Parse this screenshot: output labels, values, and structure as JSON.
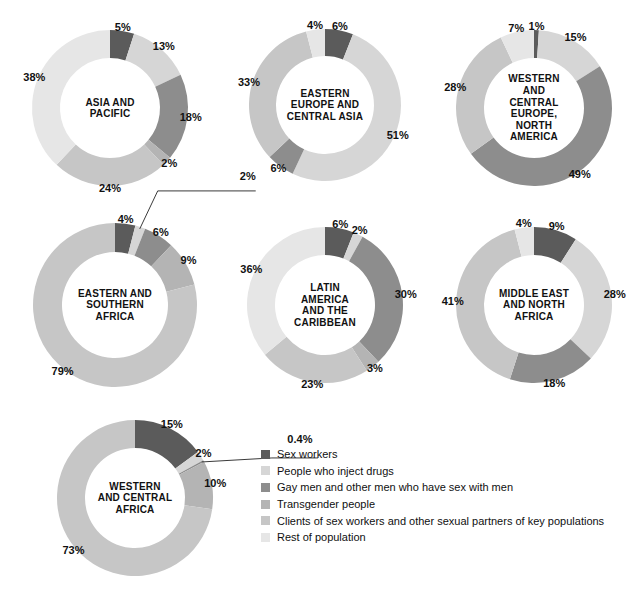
{
  "chart_data": {
    "type": "pie",
    "title": "",
    "legend_position": "bottom-right",
    "categories": [
      "Sex workers",
      "People who inject drugs",
      "Gay men and other men who have sex with men",
      "Transgender people",
      "Clients of sex workers and other sexual partners of key populations",
      "Rest of population"
    ],
    "colors": [
      "#5b5b5b",
      "#d6d6d6",
      "#8d8d8d",
      "#b4b4b4",
      "#c6c6c6",
      "#e6e6e6"
    ],
    "charts": [
      {
        "id": "asia-and-pacific",
        "title": "ASIA AND PACIFIC",
        "title_lines": [
          "ASIA AND",
          "PACIFIC"
        ],
        "values": [
          5,
          13,
          18,
          2,
          24,
          38
        ],
        "labels": [
          "5%",
          "13%",
          "18%",
          "2%",
          "24%",
          "38%"
        ]
      },
      {
        "id": "eastern-europe-and-central-asia",
        "title": "EASTERN EUROPE AND CENTRAL ASIA",
        "title_lines": [
          "EASTERN",
          "EUROPE AND",
          "CENTRAL ASIA"
        ],
        "values": [
          6,
          51,
          6,
          0,
          33,
          4
        ],
        "labels": [
          "6%",
          "51%",
          "6%",
          "",
          "33%",
          "4%"
        ]
      },
      {
        "id": "western-and-central-europe-north-america",
        "title": "WESTERN AND CENTRAL EUROPE, NORTH AMERICA",
        "title_lines": [
          "WESTERN",
          "AND",
          "CENTRAL",
          "EUROPE,",
          "NORTH",
          "AMERICA"
        ],
        "values": [
          1,
          15,
          49,
          0,
          28,
          7
        ],
        "labels": [
          "1%",
          "15%",
          "49%",
          "",
          "28%",
          "7%"
        ]
      },
      {
        "id": "eastern-and-southern-africa",
        "title": "EASTERN AND SOUTHERN AFRICA",
        "title_lines": [
          "EASTERN AND",
          "SOUTHERN",
          "AFRICA"
        ],
        "values": [
          4,
          2,
          6,
          9,
          79,
          0
        ],
        "labels": [
          "4%",
          "2%",
          "6%",
          "9%",
          "79%",
          ""
        ],
        "callouts": [
          {
            "index": 1,
            "text": "2%"
          }
        ]
      },
      {
        "id": "latin-america-and-the-caribbean",
        "title": "LATIN AMERICA AND THE CARIBBEAN",
        "title_lines": [
          "LATIN",
          "AMERICA",
          "AND THE",
          "CARIBBEAN"
        ],
        "values": [
          6,
          2,
          30,
          3,
          23,
          36
        ],
        "labels": [
          "6%",
          "2%",
          "30%",
          "3%",
          "23%",
          "36%"
        ]
      },
      {
        "id": "middle-east-and-north-africa",
        "title": "MIDDLE EAST AND NORTH AFRICA",
        "title_lines": [
          "MIDDLE EAST",
          "AND NORTH",
          "AFRICA"
        ],
        "values": [
          9,
          28,
          18,
          0,
          41,
          4
        ],
        "labels": [
          "9%",
          "28%",
          "18%",
          "",
          "41%",
          "4%"
        ]
      },
      {
        "id": "western-and-central-africa",
        "title": "WESTERN AND CENTRAL AFRICA",
        "title_lines": [
          "WESTERN",
          "AND CENTRAL",
          "AFRICA"
        ],
        "values": [
          15,
          2,
          0.4,
          10,
          73,
          0
        ],
        "labels": [
          "15%",
          "2%",
          "0.4%",
          "10%",
          "73%",
          ""
        ],
        "callouts": [
          {
            "index": 2,
            "text": "0.4%"
          }
        ]
      }
    ]
  },
  "legend": {
    "items": [
      {
        "label": "Sex workers",
        "color": "#5b5b5b"
      },
      {
        "label": "People who inject drugs",
        "color": "#d6d6d6"
      },
      {
        "label": "Gay men and other men who have sex with men",
        "color": "#8d8d8d"
      },
      {
        "label": "Transgender people",
        "color": "#b4b4b4"
      },
      {
        "label": "Clients of sex workers and other sexual partners of key populations",
        "color": "#c6c6c6"
      },
      {
        "label": "Rest of population",
        "color": "#e6e6e6"
      }
    ]
  },
  "layout": {
    "donuts": [
      {
        "id": "asia-and-pacific",
        "cx": 110,
        "cy": 108,
        "r_outer": 78,
        "r_inner": 50
      },
      {
        "id": "eastern-europe-and-central-asia",
        "cx": 325,
        "cy": 105,
        "r_outer": 76,
        "r_inner": 49
      },
      {
        "id": "western-and-central-europe-north-america",
        "cx": 534,
        "cy": 108,
        "r_outer": 78,
        "r_inner": 50
      },
      {
        "id": "eastern-and-southern-africa",
        "cx": 115,
        "cy": 305,
        "r_outer": 82,
        "r_inner": 53
      },
      {
        "id": "latin-america-and-the-caribbean",
        "cx": 325,
        "cy": 305,
        "r_outer": 78,
        "r_inner": 50
      },
      {
        "id": "middle-east-and-north-africa",
        "cx": 534,
        "cy": 305,
        "r_outer": 78,
        "r_inner": 50
      },
      {
        "id": "western-and-central-africa",
        "cx": 135,
        "cy": 498,
        "r_outer": 78,
        "r_inner": 50
      }
    ],
    "callout_geometry": {
      "eastern-and-southern-africa": {
        "elbow_dx": 18,
        "elbow_dy": -38,
        "run": 98,
        "text_dx": 108,
        "text_dy": -52
      },
      "western-and-central-africa": {
        "elbow_dx": 70,
        "elbow_dy": -4,
        "run": 46,
        "text_dx": 98,
        "text_dy": -22
      }
    }
  }
}
